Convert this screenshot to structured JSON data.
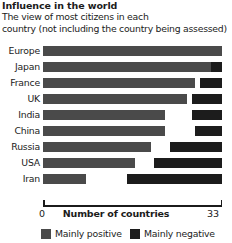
{
  "title": "Influence in the world",
  "subtitle_line1": "The view of most citizens in each",
  "subtitle_line2": "country (not including the country being assessed)",
  "axis": {
    "title": "Number of countries",
    "min_label": "0",
    "max_label": "33"
  },
  "legend": {
    "positive_label": "Mainly positive",
    "negative_label": "Mainly negative",
    "positive_color": "#4a4a4a",
    "negative_color": "#1c1c1c"
  },
  "chart_data": {
    "type": "bar",
    "title": "Influence in the world",
    "subtitle": "The view of most citizens in each country (not including the country being assessed)",
    "xlabel": "Number of countries",
    "ylabel": "",
    "xlim": [
      0,
      33
    ],
    "grid": false,
    "legend_position": "bottom",
    "orientation": "horizontal",
    "categories": [
      "Europe",
      "Japan",
      "France",
      "UK",
      "India",
      "China",
      "Russia",
      "USA",
      "Iran"
    ],
    "series": [
      {
        "name": "Mainly positive",
        "color": "#4a4a4a",
        "values": [
          33,
          31,
          28,
          26.5,
          22.5,
          22.5,
          20,
          17,
          8
        ],
        "starts": [
          0,
          0,
          0,
          0,
          0,
          0,
          0,
          0,
          0
        ]
      },
      {
        "name": "Mainly negative",
        "color": "#1c1c1c",
        "values": [
          0,
          2,
          4,
          5.5,
          5.5,
          5,
          9.5,
          12.5,
          17.5
        ],
        "starts": [
          33,
          31,
          29,
          27.5,
          27.5,
          28,
          23.5,
          20.5,
          15.5
        ]
      }
    ]
  },
  "rows": [
    {
      "label": "Europe",
      "pos_start": 0,
      "pos_end": 33,
      "neg_start": 33,
      "neg_end": 33
    },
    {
      "label": "Japan",
      "pos_start": 0,
      "pos_end": 31,
      "neg_start": 31,
      "neg_end": 33
    },
    {
      "label": "France",
      "pos_start": 0,
      "pos_end": 28,
      "neg_start": 29,
      "neg_end": 33
    },
    {
      "label": "UK",
      "pos_start": 0,
      "pos_end": 26.5,
      "neg_start": 27.5,
      "neg_end": 33
    },
    {
      "label": "India",
      "pos_start": 0,
      "pos_end": 22.5,
      "neg_start": 27.5,
      "neg_end": 33
    },
    {
      "label": "China",
      "pos_start": 0,
      "pos_end": 22.5,
      "neg_start": 28,
      "neg_end": 33
    },
    {
      "label": "Russia",
      "pos_start": 0,
      "pos_end": 20,
      "neg_start": 23.5,
      "neg_end": 33
    },
    {
      "label": "USA",
      "pos_start": 0,
      "pos_end": 17,
      "neg_start": 20.5,
      "neg_end": 33
    },
    {
      "label": "Iran",
      "pos_start": 0,
      "pos_end": 8,
      "neg_start": 15.5,
      "neg_end": 33
    }
  ]
}
